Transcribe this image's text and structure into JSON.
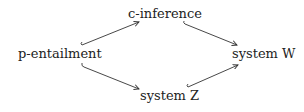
{
  "diagram": {
    "type": "inclusion-lattice",
    "nodes": {
      "top": "c-inference",
      "left": "p-entailment",
      "right": "system W",
      "bottom": "system Z"
    },
    "edges": [
      {
        "from": "p-entailment",
        "to": "c-inference",
        "style": "hook-arrow"
      },
      {
        "from": "c-inference",
        "to": "system W",
        "style": "arrow"
      },
      {
        "from": "p-entailment",
        "to": "system Z",
        "style": "arrow"
      },
      {
        "from": "system Z",
        "to": "system W",
        "style": "hook-arrow"
      }
    ],
    "colors": {
      "text": "#222222",
      "arrow": "#333333",
      "background": "#ffffff"
    }
  }
}
